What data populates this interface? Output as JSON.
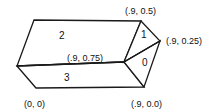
{
  "figure": {
    "type": "prism-wireframe-diagram",
    "background_color": "#ffffff",
    "stroke_color": "#1a1a1a",
    "text_color": "#111111"
  },
  "vertex_labels": [
    {
      "name": "top-right-vertex-label",
      "text": "(.9, 0.5)",
      "x": 125,
      "y": 6
    },
    {
      "name": "right-tip-vertex-label",
      "text": "(.9, 0.25)",
      "x": 166,
      "y": 36
    },
    {
      "name": "middle-junction-label",
      "text": "(.9, 0.75)",
      "x": 67,
      "y": 53
    },
    {
      "name": "origin-vertex-label",
      "text": "(0, 0)",
      "x": 24,
      "y": 99
    },
    {
      "name": "bottom-right-vertex-label",
      "text": "(.9, 0.0)",
      "x": 131,
      "y": 99
    }
  ],
  "face_labels": [
    {
      "name": "face-label-2",
      "text": "2",
      "x": 59,
      "y": 31
    },
    {
      "name": "face-label-3",
      "text": "3",
      "x": 64,
      "y": 73
    },
    {
      "name": "face-label-1",
      "text": "1",
      "x": 141,
      "y": 30
    },
    {
      "name": "face-label-0",
      "text": "0",
      "x": 142,
      "y": 58
    }
  ],
  "geometry": {
    "top_left": [
      34,
      20
    ],
    "top_right": [
      141,
      21
    ],
    "left_vertex": [
      17,
      66
    ],
    "mid_junction": [
      124,
      62
    ],
    "right_tip": [
      160,
      41
    ],
    "bottom_left": [
      36,
      88
    ],
    "bottom_right": [
      144,
      87
    ]
  }
}
